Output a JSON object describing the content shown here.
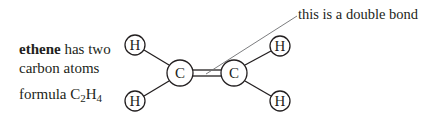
{
  "description": {
    "line1_bold": "ethene",
    "line1_rest": " has two",
    "line2": "carbon atoms",
    "formula_prefix": "formula C",
    "formula_sub1": "2",
    "formula_mid": "H",
    "formula_sub2": "4"
  },
  "annotation": {
    "label": "this is a double bond"
  },
  "molecule": {
    "name": "ethene",
    "atoms": [
      {
        "id": "H1",
        "symbol": "H",
        "x": 135,
        "y": 45,
        "r": 10
      },
      {
        "id": "H2",
        "symbol": "H",
        "x": 135,
        "y": 101,
        "r": 10
      },
      {
        "id": "C1",
        "symbol": "C",
        "x": 180,
        "y": 73,
        "r": 13
      },
      {
        "id": "C2",
        "symbol": "C",
        "x": 234,
        "y": 73,
        "r": 13
      },
      {
        "id": "H3",
        "symbol": "H",
        "x": 280,
        "y": 46,
        "r": 10
      },
      {
        "id": "H4",
        "symbol": "H",
        "x": 280,
        "y": 101,
        "r": 10
      }
    ],
    "bonds": [
      {
        "from": "H1",
        "to": "C1",
        "order": 1
      },
      {
        "from": "H2",
        "to": "C1",
        "order": 1
      },
      {
        "from": "C1",
        "to": "C2",
        "order": 2
      },
      {
        "from": "C2",
        "to": "H3",
        "order": 1
      },
      {
        "from": "C2",
        "to": "H4",
        "order": 1
      }
    ]
  },
  "colors": {
    "ink": "#231f20",
    "leader": "#6d6e71",
    "background": "#ffffff"
  }
}
